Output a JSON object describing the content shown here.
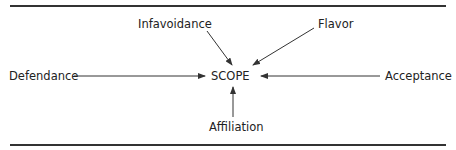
{
  "diagram": {
    "center": {
      "label": "SCOPE",
      "x": 232,
      "y": 75
    },
    "nodes": [
      {
        "id": "defendance",
        "label": "Defendance",
        "x": 9,
        "y": 69
      },
      {
        "id": "infavoidance",
        "label": "Infavoidance",
        "x": 138,
        "y": 17
      },
      {
        "id": "flavor",
        "label": "Flavor",
        "x": 318,
        "y": 17
      },
      {
        "id": "acceptance",
        "label": "Acceptance",
        "x": 385,
        "y": 69
      },
      {
        "id": "affiliation",
        "label": "Affiliation",
        "x": 209,
        "y": 120
      }
    ],
    "edges": [
      {
        "from": "Defendance",
        "to": "SCOPE",
        "x1": 74,
        "y1": 76,
        "x2": 205,
        "y2": 76
      },
      {
        "from": "Infavoidance",
        "to": "SCOPE",
        "x1": 207,
        "y1": 31,
        "x2": 232,
        "y2": 65
      },
      {
        "from": "Flavor",
        "to": "SCOPE",
        "x1": 314,
        "y1": 28,
        "x2": 253,
        "y2": 65
      },
      {
        "from": "Acceptance",
        "to": "SCOPE",
        "x1": 380,
        "y1": 76,
        "x2": 261,
        "y2": 76
      },
      {
        "from": "Affiliation",
        "to": "SCOPE",
        "x1": 233,
        "y1": 117,
        "x2": 233,
        "y2": 87
      }
    ],
    "colors": {
      "line": "#333333",
      "text": "#222222"
    }
  }
}
